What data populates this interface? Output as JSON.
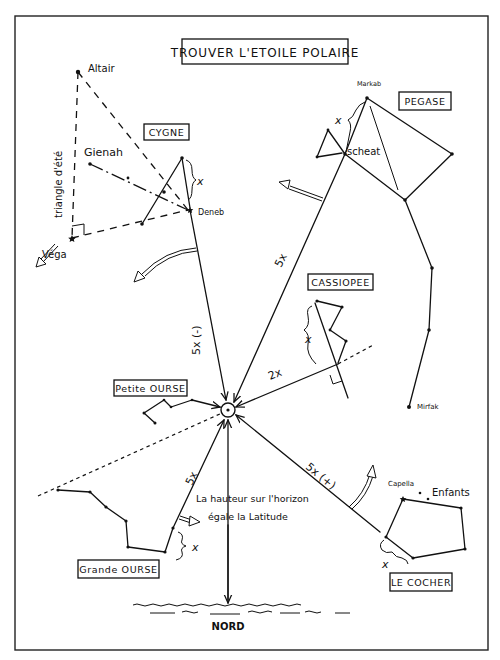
{
  "title": "TROUVER L'ETOILE POLAIRE",
  "constellations": {
    "cygne": "CYGNE",
    "pegase": "PEGASE",
    "cassiopee": "CASSIOPEE",
    "petite_ourse": "Petite OURSE",
    "grande_ourse": "Grande OURSE",
    "le_cocher": "LE COCHER"
  },
  "stars": {
    "altair": "Altair",
    "gienah": "Gienah",
    "deneb": "Deneb",
    "vega": "Véga",
    "markab": "Markab",
    "scheat": "scheat",
    "mirfak": "Mirfak",
    "capella": "Capella",
    "enfants": "Enfants"
  },
  "annotations": {
    "triangle_ete": "triangle d'été",
    "x_symbol": "x",
    "cygne_distance": "5x (-)",
    "pegase_distance": "5x",
    "cassiopee_distance": "2x",
    "grande_ourse_distance": "5x",
    "cocher_distance": "5x (+)",
    "hauteur_line1": "La hauteur sur l'horizon",
    "hauteur_line2": "égale la Latitude",
    "nord": "NORD"
  },
  "colors": {
    "ink": "#111111",
    "paper": "#ffffff"
  }
}
